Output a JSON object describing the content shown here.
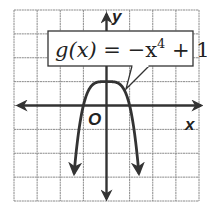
{
  "chart_data": {
    "type": "line",
    "title": "",
    "function_label": "g(x) = −x⁴ + 1",
    "function_label_parts": {
      "name": "g",
      "arg": "(x)",
      "eq": " = −x",
      "exp": "4",
      "tail": " + 1"
    },
    "xlabel": "x",
    "ylabel": "y",
    "origin_label": "O",
    "xlim": [
      -4,
      4
    ],
    "ylim": [
      -4,
      4
    ],
    "grid": true,
    "grid_step": 1,
    "series": [
      {
        "name": "g(x) = -x^4 + 1",
        "x": [
          -1.4,
          -1.3,
          -1.2,
          -1.1,
          -1.0,
          -0.8,
          -0.6,
          -0.4,
          -0.2,
          0,
          0.2,
          0.4,
          0.6,
          0.8,
          1.0,
          1.1,
          1.2,
          1.3,
          1.4
        ],
        "y": [
          -2.84,
          -1.86,
          -1.07,
          -0.46,
          0,
          0.59,
          0.87,
          0.97,
          1.0,
          1.0,
          1.0,
          0.97,
          0.87,
          0.59,
          0,
          -0.46,
          -1.07,
          -1.86,
          -2.84
        ],
        "arrows_at_ends": true
      }
    ],
    "key_points": {
      "y_intercept": [
        0,
        1
      ],
      "x_intercepts": [
        [
          -1,
          0
        ],
        [
          1,
          0
        ]
      ]
    },
    "colors": {
      "curve": "#333333",
      "axes": "#333333",
      "grid": "#8a8a8a",
      "background": "#ffffff"
    }
  }
}
